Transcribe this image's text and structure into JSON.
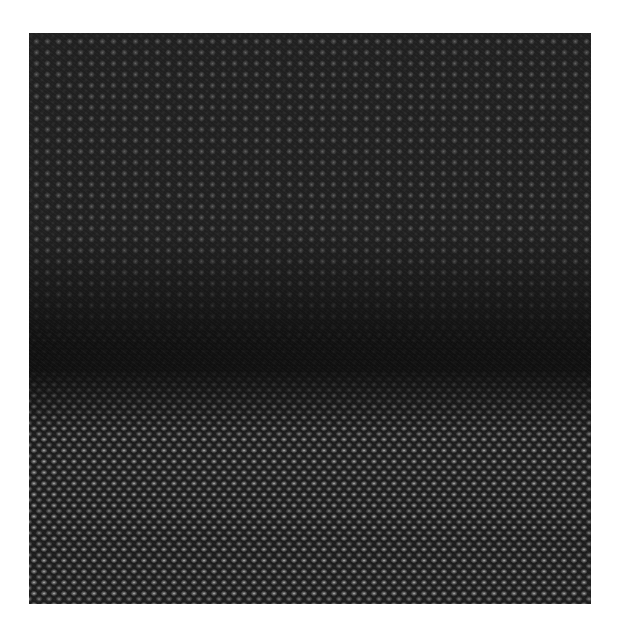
{
  "image": {
    "kind": "high-resolution electron micrograph",
    "description": "Atomic lattice with two crystalline regions separated by a dark horizontal interface band",
    "regions": [
      {
        "name": "upper-crystal",
        "lattice": "square",
        "spot_spacing_px": 11,
        "brightness": "dim"
      },
      {
        "name": "interface-band",
        "lattice": "disordered",
        "brightness": "dark"
      },
      {
        "name": "lower-crystal",
        "lattice": "staggered-diagonal",
        "spot_spacing_px": 10,
        "brightness": "bright"
      }
    ],
    "colors": {
      "background": "#ffffff",
      "matrix": "#1e1e1e",
      "upper_spots": "#969696",
      "lower_spots": "#d2d2d2",
      "interface": "#0f0f0f"
    }
  }
}
